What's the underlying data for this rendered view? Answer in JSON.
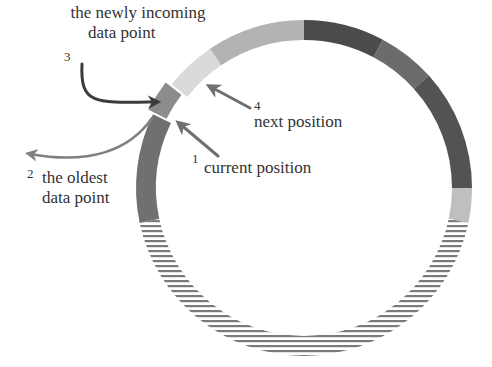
{
  "diagram": {
    "ring": {
      "cx": 304,
      "cy": 188,
      "r_outer": 168,
      "r_inner": 148,
      "segments": [
        {
          "name": "segment-dark-1",
          "start": -90,
          "end": -62,
          "fill": "#4b4b4b",
          "pattern": "solid"
        },
        {
          "name": "segment-medium-1",
          "start": -62,
          "end": -42,
          "fill": "#6b6b6b",
          "pattern": "solid"
        },
        {
          "name": "segment-dark-2",
          "start": -42,
          "end": 0,
          "fill": "#535353",
          "pattern": "solid"
        },
        {
          "name": "segment-light-1",
          "start": 0,
          "end": 12,
          "fill": "#bfbfbf",
          "pattern": "solid"
        },
        {
          "name": "segment-empty-hatched",
          "start": 12,
          "end": 168,
          "fill": "#7a7a7a",
          "pattern": "hatch"
        },
        {
          "name": "segment-oldest",
          "start": 168,
          "end": 206,
          "fill": "#707070",
          "pattern": "solid"
        },
        {
          "name": "segment-next-position",
          "start": 218,
          "end": 236,
          "fill": "#dadada",
          "pattern": "solid"
        },
        {
          "name": "segment-light-2",
          "start": 236,
          "end": 270,
          "fill": "#b3b3b3",
          "pattern": "solid"
        }
      ],
      "current_cell": {
        "name": "current-position-cell",
        "start": 206.5,
        "end": 217.5,
        "fill": "#8c8c8c",
        "offset": 6
      }
    },
    "annotations": [
      {
        "id": "1",
        "number": "1",
        "text": "current position"
      },
      {
        "id": "2",
        "number": "2",
        "text_lines": [
          "the oldest",
          "data point"
        ]
      },
      {
        "id": "3",
        "number": "3",
        "text_lines": [
          "the newly incoming",
          "data point"
        ]
      },
      {
        "id": "4",
        "number": "4",
        "text": "next position"
      }
    ],
    "arrows": [
      {
        "name": "arrow-current-position",
        "path": "M218,156 L180,124",
        "color": "#707070",
        "width": 3
      },
      {
        "name": "arrow-next-position",
        "path": "M250,108 L211,87",
        "color": "#707070",
        "width": 3
      },
      {
        "name": "arrow-oldest-data-point",
        "path": "M152,118 C130,150 90,165 30,154",
        "color": "#808080",
        "width": 2.5
      },
      {
        "name": "arrow-newly-incoming",
        "path": "M82,64 C80,105 95,103 156,102",
        "color": "#3c3c3c",
        "width": 3
      }
    ]
  }
}
